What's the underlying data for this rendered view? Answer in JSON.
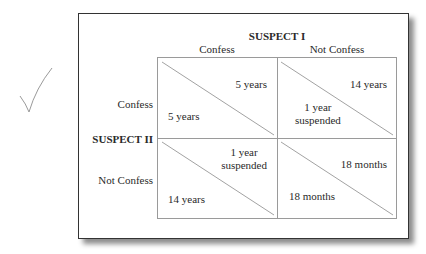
{
  "figure": {
    "type": "payoff-matrix",
    "player_top": "SUSPECT I",
    "player_left": "SUSPECT II",
    "columns": [
      "Confess",
      "Not Confess"
    ],
    "rows": [
      "Confess",
      "Not Confess"
    ],
    "cells": [
      [
        {
          "suspect1": "5 years",
          "suspect2": "5 years"
        },
        {
          "suspect1": "14 years",
          "suspect2_line1": "1 year",
          "suspect2_line2": "suspended"
        }
      ],
      [
        {
          "suspect1_line1": "1 year",
          "suspect1_line2": "suspended",
          "suspect2": "14 years"
        },
        {
          "suspect1": "18 months",
          "suspect2": "18 months"
        }
      ]
    ],
    "checkmark": "check-mark"
  }
}
